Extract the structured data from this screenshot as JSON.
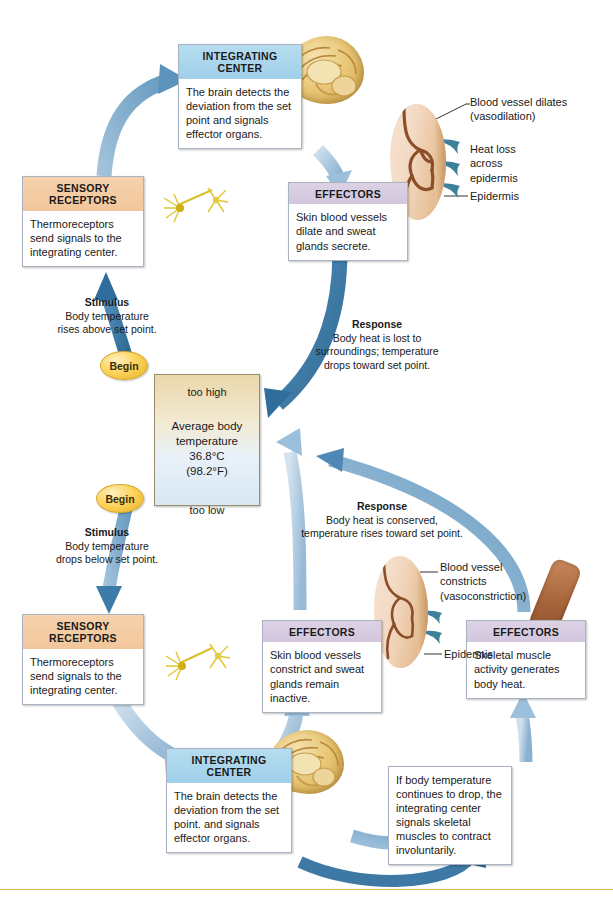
{
  "figure": {
    "bottom_rule_color": "#d9b84a"
  },
  "palette": {
    "integrating_header": "#9fd0e9",
    "sensory_header": "#f2c69b",
    "effector_header": "#d2c6dd",
    "arrow_dark_blue": "#2e6d9c",
    "arrow_light_blue": "#8fb6d4",
    "begin_yellow": "#fbd55f",
    "setpoint_warm": "#e9d7ac",
    "setpoint_cool": "#d8e8f4"
  },
  "setpoint": {
    "too_high": "too high",
    "line1": "Average body",
    "line2": "temperature",
    "line3": "36.8°C",
    "line4": "(98.2°F)",
    "too_low": "too low"
  },
  "begin_labels": {
    "upper": "Begin",
    "lower": "Begin"
  },
  "upper_loop": {
    "stimulus": {
      "title": "Stimulus",
      "line1": "Body temperature",
      "line2": "rises above set point."
    },
    "sensory_receptors": {
      "header_line1": "SENSORY",
      "header_line2": "RECEPTORS",
      "body": "Thermoreceptors send signals to the integrating center."
    },
    "integrating_center": {
      "header_line1": "INTEGRATING",
      "header_line2": "CENTER",
      "body": "The brain detects the deviation from the set point and signals effector organs."
    },
    "effectors": {
      "header": "EFFECTORS",
      "body": "Skin blood vessels dilate and sweat glands secrete."
    },
    "response": {
      "title": "Response",
      "line1": "Body heat is lost to",
      "line2": "surroundings; temperature",
      "line3": "drops toward set point."
    },
    "skin_labels": {
      "vessel_line1": "Blood vessel dilates",
      "vessel_line2": "(vasodilation)",
      "heat_line1": "Heat loss",
      "heat_line2": "across",
      "heat_line3": "epidermis",
      "epidermis": "Epidermis"
    }
  },
  "lower_loop": {
    "stimulus": {
      "title": "Stimulus",
      "line1": "Body temperature",
      "line2": "drops below set point."
    },
    "sensory_receptors": {
      "header_line1": "SENSORY",
      "header_line2": "RECEPTORS",
      "body": "Thermoreceptors send signals to the integrating center."
    },
    "integrating_center": {
      "header_line1": "INTEGRATING",
      "header_line2": "CENTER",
      "body": "The brain detects the deviation from the set point. and signals effector organs."
    },
    "effectors_skin": {
      "header": "EFFECTORS",
      "body": "Skin blood vessels constrict and sweat glands remain inactive."
    },
    "effectors_muscle": {
      "header": "EFFECTORS",
      "body": "Skeletal muscle activity generates body heat."
    },
    "shivering_note": "If body temperature continues to drop, the integrating center signals skeletal muscles to contract involuntarily.",
    "response": {
      "title": "Response",
      "line1": "Body heat is conserved,",
      "line2": "temperature rises toward set point."
    },
    "skin_labels": {
      "vessel_line1": "Blood vessel",
      "vessel_line2": "constricts",
      "vessel_line3": "(vasoconstriction)",
      "epidermis": "Epidermis"
    }
  }
}
